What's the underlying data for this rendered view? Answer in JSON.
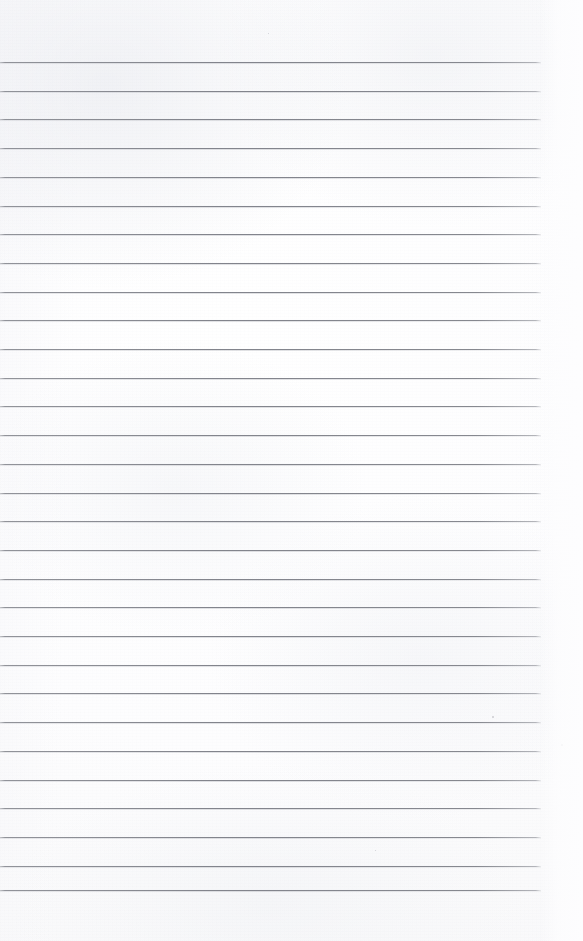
{
  "document": {
    "kind": "scanned-lined-notebook-page",
    "title": "Blank Lined Notebook Page",
    "description": "A scanned blank sheet of ruled notebook paper with no handwriting or printed text.",
    "page_width": 583,
    "page_height": 941,
    "text_content": "",
    "has_handwriting": false,
    "has_printed_text": false
  },
  "paper": {
    "background_color": "#fdfdfe",
    "tint": "near-white",
    "noise_opacity": 0.5
  },
  "ruling": {
    "line_color": "#84868d",
    "line_thickness_px": 1,
    "line_start_x": 0,
    "line_end_x": 541,
    "first_line_y": 62,
    "line_spacing_px": 28.7,
    "line_count": 30,
    "top_margin_px": 62,
    "bottom_margin_px": 51,
    "right_margin_px": 42,
    "line_positions_y": [
      62,
      90.7,
      119.4,
      148.1,
      176.8,
      205.5,
      234.2,
      262.9,
      291.6,
      320.3,
      349.0,
      377.7,
      406.4,
      435.1,
      463.8,
      492.5,
      521.2,
      549.9,
      578.6,
      607.3,
      636.0,
      664.7,
      693.4,
      722.1,
      750.8,
      779.5,
      808.2,
      836.9,
      865.6,
      890.0
    ]
  },
  "artifacts": {
    "specks": [
      {
        "x": 492,
        "y": 716,
        "size": 2
      },
      {
        "x": 561,
        "y": 744,
        "size": 2
      },
      {
        "x": 268,
        "y": 33,
        "size": 1
      },
      {
        "x": 375,
        "y": 850,
        "size": 1
      }
    ]
  }
}
